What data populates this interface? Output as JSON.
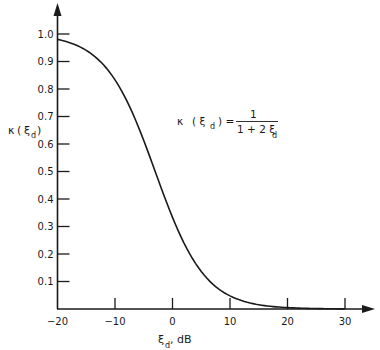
{
  "chart_data": {
    "type": "line",
    "title": "",
    "xlabel": "ξ_d, dB",
    "ylabel": "κ(ξ_d)",
    "xlim": [
      -20,
      33
    ],
    "ylim": [
      0,
      1.05
    ],
    "grid": false,
    "legend": null,
    "x_ticks": [
      "-20",
      "-10",
      "0",
      "10",
      "20",
      "30"
    ],
    "y_ticks": [
      "0.1",
      "0.2",
      "0.3",
      "0.4",
      "0.5",
      "0.6",
      "0.7",
      "0.8",
      "0.9",
      "1.0"
    ],
    "annotation": "κ(ξ_d) = 1 / (1 + 2ξ_d)",
    "series": [
      {
        "name": "κ(ξ_d)",
        "x": [
          -20,
          -15,
          -10,
          -7.5,
          -5,
          -2.5,
          0,
          2.5,
          5,
          7.5,
          10,
          15,
          20,
          25,
          30
        ],
        "values": [
          0.98,
          0.941,
          0.833,
          0.738,
          0.613,
          0.471,
          0.333,
          0.22,
          0.137,
          0.082,
          0.048,
          0.016,
          0.005,
          0.002,
          0.0005
        ]
      }
    ]
  },
  "labels": {
    "y_axis_kappa": "κ",
    "y_axis_open": "(",
    "y_axis_xi": "ξ",
    "y_axis_sub": "d",
    "y_axis_close": ")",
    "x_axis_xi": "ξ",
    "x_axis_sub": "d",
    "x_axis_unit": ", dB",
    "formula_lhs_kappa": "κ",
    "formula_lhs_arg": "( ξ",
    "formula_lhs_sub": "d",
    "formula_lhs_close": ") =",
    "formula_numerator": "1",
    "formula_denominator": "1 + 2 ξ",
    "formula_den_sub": "d"
  }
}
